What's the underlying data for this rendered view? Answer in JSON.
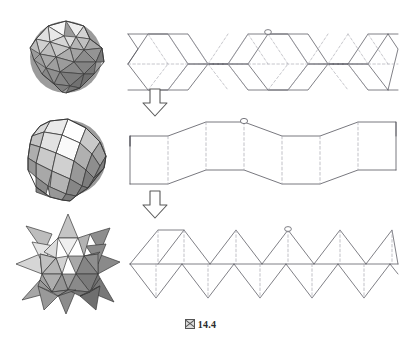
{
  "figure": {
    "caption_glyph": "☒",
    "caption_label": "14.4",
    "top_bleed_text": "                       ",
    "background_color": "#ffffff",
    "line_color": "#4a4a52",
    "dashed_color": "#9a9aa2",
    "arrow_color": "#555555"
  },
  "rows": [
    {
      "index": 1,
      "solid": {
        "name": "pentakis-dodecahedron",
        "face_type": "triangle",
        "shades": [
          "#fbfbfb",
          "#ededed",
          "#dedede",
          "#cccccc",
          "#b8b8b8",
          "#a6a6a6",
          "#939393",
          "#848484",
          "#777777"
        ]
      },
      "net": {
        "name": "triangle-zigzag-strip",
        "unit_count": 6,
        "marker": "circle",
        "solid_edges": "outline-zigzag",
        "dashed_edges": "internal-diagonals"
      }
    },
    {
      "index": 2,
      "solid": {
        "name": "rhombic-triacontahedron",
        "face_type": "rhombus",
        "shades": [
          "#ffffff",
          "#f2f2f2",
          "#e2e2e2",
          "#cfcfcf",
          "#bcbcbc",
          "#a8a8a8",
          "#969696",
          "#868686",
          "#7a7a7a"
        ]
      },
      "net": {
        "name": "rhombus-zigzag-band",
        "unit_count": 7,
        "marker": "circle",
        "solid_edges": "band-outline",
        "dashed_edges": "vertical-folds"
      }
    },
    {
      "index": 3,
      "solid": {
        "name": "stellated-polyhedron",
        "face_type": "triangular-spike",
        "shades": [
          "#f4f4f4",
          "#e4e4e4",
          "#d2d2d2",
          "#bfbfbf",
          "#ababab",
          "#979797",
          "#868686",
          "#767676",
          "#6a6a6a"
        ]
      },
      "net": {
        "name": "spiked-triangle-strip",
        "unit_count": 6,
        "marker": "circle",
        "solid_edges": "triangle-outlines",
        "dashed_edges": "vertical-folds"
      }
    }
  ],
  "arrows": [
    {
      "name": "transform-arrow-1",
      "direction": "down"
    },
    {
      "name": "transform-arrow-2",
      "direction": "down"
    }
  ]
}
